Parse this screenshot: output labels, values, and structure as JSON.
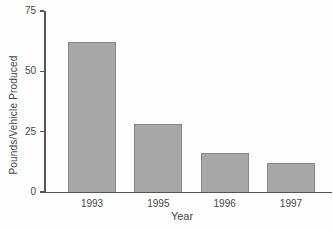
{
  "chart_data": {
    "type": "bar",
    "categories": [
      "1993",
      "1995",
      "1996",
      "1997"
    ],
    "values": [
      62,
      28,
      16,
      12
    ],
    "xlabel": "Year",
    "ylabel": "Pounds/Vehicle Produced",
    "ylim": [
      0,
      75
    ],
    "yticks": [
      0,
      25,
      50,
      75
    ],
    "grid": false,
    "legend": "none",
    "bar_fill_color": "#a7a7a7",
    "bar_border_color": "#878787",
    "axis_color": "#555555",
    "text_color": "#474747",
    "background_color": "#fdfdfd"
  }
}
